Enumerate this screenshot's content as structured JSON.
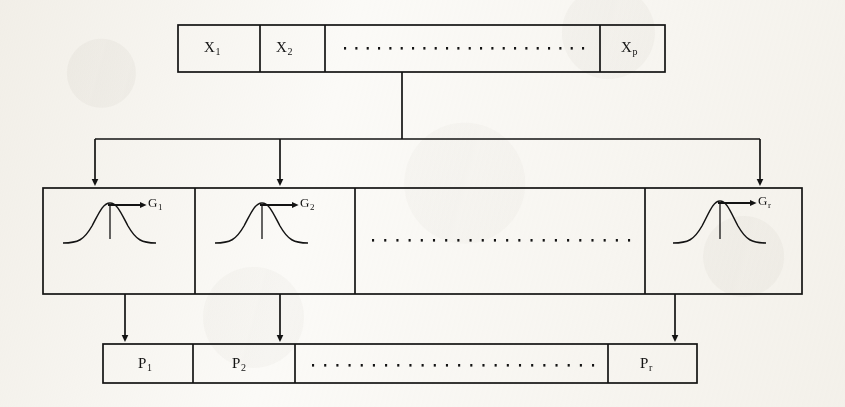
{
  "figure": {
    "kind": "block-diagram",
    "ink_color": "#131313",
    "page_color": "#fbfaf7"
  },
  "input_layer": {
    "name": "input-vector",
    "cells": [
      {
        "base": "X",
        "sub": "1",
        "kind": "variable"
      },
      {
        "base": "X",
        "sub": "2",
        "kind": "variable"
      },
      {
        "base": "",
        "sub": "",
        "kind": "ellipsis",
        "dots": 22
      },
      {
        "base": "X",
        "sub": "p",
        "kind": "variable"
      }
    ]
  },
  "hidden_layer": {
    "name": "gaussian-unit-row",
    "cells": [
      {
        "base": "G",
        "sub": "1",
        "kind": "gaussian-unit"
      },
      {
        "base": "G",
        "sub": "2",
        "kind": "gaussian-unit"
      },
      {
        "base": "",
        "sub": "",
        "kind": "ellipsis",
        "dots": 22
      },
      {
        "base": "G",
        "sub": "r",
        "kind": "gaussian-unit"
      }
    ]
  },
  "output_layer": {
    "name": "output-vector",
    "cells": [
      {
        "base": "P",
        "sub": "1",
        "kind": "variable"
      },
      {
        "base": "P",
        "sub": "2",
        "kind": "variable"
      },
      {
        "base": "",
        "sub": "",
        "kind": "ellipsis",
        "dots": 24
      },
      {
        "base": "P",
        "sub": "r",
        "kind": "variable"
      }
    ]
  },
  "connections": {
    "fanout_from_input": {
      "branches": 3,
      "style": "bus-with-arrowheads"
    },
    "hidden_to_output": {
      "branches": 3,
      "style": "straight-arrows"
    }
  }
}
